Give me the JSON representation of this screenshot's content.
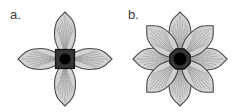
{
  "figure": {
    "caption_labels": [
      "a.",
      "b."
    ],
    "background_color": "#ffffff",
    "width": 237,
    "height": 112,
    "panels": [
      {
        "id": "a",
        "label": "a.",
        "diagram_type": "flower-schematic",
        "petal_count": 4,
        "petal_layers": 1,
        "petal_angles_deg": [
          0,
          90,
          180,
          270
        ],
        "petal_fill_color": "#d2d2d2",
        "petal_stroke_color": "#4a4a4a",
        "vein_color": "#8d8d8d",
        "vein_style": "dotted",
        "vein_count_per_petal": 9,
        "center_shape": "square",
        "center_fill_color": "#343434",
        "center_stroke_color": "#111111",
        "center_size_px": 19,
        "disc_shape": "circle",
        "disc_fill_color": "#000000",
        "disc_diameter_px": 11,
        "center_x": 65,
        "center_y": 59,
        "petal_length_px": 47,
        "petal_width_px": 21
      },
      {
        "id": "b",
        "label": "b.",
        "diagram_type": "flower-schematic",
        "petal_count": 8,
        "petal_layers": 2,
        "petal_angles_deg": [
          0,
          45,
          90,
          135,
          180,
          225,
          270,
          315
        ],
        "back_layer_angles_deg": [
          0,
          90,
          180,
          270
        ],
        "front_layer_angles_deg": [
          45,
          135,
          225,
          315
        ],
        "petal_fill_color": "#d2d2d2",
        "petal_stroke_color": "#4a4a4a",
        "vein_color": "#8d8d8d",
        "vein_style": "dotted",
        "vein_count_per_petal": 9,
        "center_shape": "octagon",
        "center_fill_color": "#343434",
        "center_stroke_color": "#111111",
        "center_size_px": 22,
        "disc_shape": "circle",
        "disc_fill_color": "#000000",
        "disc_diameter_px": 13,
        "center_x": 62,
        "center_y": 59,
        "petal_length_px": 47,
        "petal_width_px": 22
      }
    ]
  }
}
